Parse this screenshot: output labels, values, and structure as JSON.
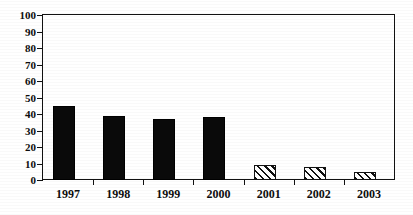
{
  "chart_data": {
    "type": "bar",
    "title": "",
    "subtitle": "",
    "xlabel": "",
    "ylabel": "",
    "categories": [
      "1997",
      "1998",
      "1999",
      "2000",
      "2001",
      "2002",
      "2003"
    ],
    "values": [
      45,
      39,
      37,
      38,
      9,
      8,
      5
    ],
    "series": [
      {
        "name": "",
        "values": [
          45,
          39,
          37,
          38,
          9,
          8,
          5
        ],
        "fills": [
          "solid",
          "solid",
          "solid",
          "solid",
          "hatch",
          "hatch",
          "hatch"
        ]
      }
    ],
    "ylim": [
      0,
      100
    ],
    "ytick_labels": [
      "0",
      "10",
      "20",
      "30",
      "40",
      "50",
      "60",
      "70",
      "80",
      "90",
      "100"
    ],
    "ytick_values": [
      0,
      10,
      20,
      30,
      40,
      50,
      60,
      70,
      80,
      90,
      100
    ],
    "ytick_step": 10,
    "grid": false,
    "legend": null,
    "legend_position": "none",
    "annotations": [],
    "colors": {
      "bar_solid": "#0a0a0a",
      "bar_hatch_stroke": "#101010",
      "bar_hatch_background": "#ffffff",
      "axis": "#111111",
      "text": "#0d0d0d",
      "plot_background": "#ffffff"
    },
    "bar_style_note": {
      "solid": "filled black",
      "hatch": "white with diagonal stripes"
    }
  }
}
